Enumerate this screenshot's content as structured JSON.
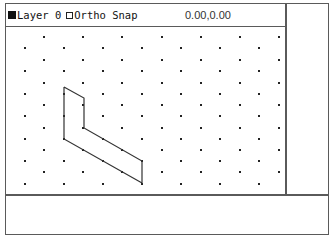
{
  "status_bar": {
    "layer_indicator": "filled-square-icon",
    "layer_label": "Layer 0",
    "ortho_indicator": "empty-checkbox-icon",
    "ortho_label": "Ortho",
    "snap_label": "Snap",
    "coordinates": "0.00,0.00"
  },
  "drawing": {
    "grid_type": "isometric",
    "grid": {
      "row_a_y": [
        37,
        60,
        83,
        105,
        128,
        150,
        172
      ],
      "row_a_x": [
        44,
        83,
        122,
        162,
        201,
        240,
        279
      ],
      "row_b_y": [
        48,
        71,
        94,
        116,
        139,
        161,
        184
      ],
      "row_b_x": [
        25,
        64,
        103,
        142,
        181,
        220,
        259
      ]
    },
    "polyline_points": [
      [
        64,
        87
      ],
      [
        84,
        98
      ],
      [
        84,
        128
      ],
      [
        142,
        161
      ],
      [
        142,
        183
      ],
      [
        64,
        139
      ],
      [
        64,
        87
      ]
    ],
    "line_color": "#333333",
    "dot_color": "#222222"
  },
  "command_area": {
    "text": ""
  },
  "colors": {
    "border": "#5a5a5a",
    "background": "#ffffff"
  }
}
